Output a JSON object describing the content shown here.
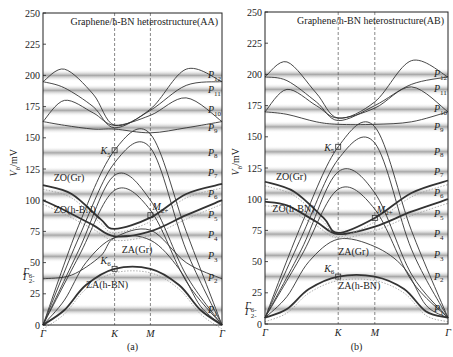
{
  "chart_data": [
    {
      "type": "line",
      "panel": "(a)",
      "title": "Graphene/h-BN heterostructure(AA)",
      "xlabel": "",
      "ylabel": "V_b/mV",
      "ylim": [
        0,
        250
      ],
      "yticks": [
        0,
        25,
        50,
        75,
        100,
        125,
        150,
        175,
        200,
        225,
        250
      ],
      "xticks": [
        "Γ",
        "K",
        "M",
        "Γ"
      ],
      "x": [
        0,
        1,
        1.5,
        2.5
      ],
      "peak_labels": [
        "P1",
        "P2",
        "P3",
        "P4",
        "P5",
        "P6",
        "P7",
        "P8",
        "P9",
        "P10",
        "P11",
        "P12"
      ],
      "peak_positions_mV": [
        12,
        38,
        55,
        72,
        88,
        105,
        122,
        138,
        158,
        172,
        188,
        200
      ],
      "annotations": [
        {
          "text": "K5",
          "x": 1,
          "y": 140
        },
        {
          "text": "M2+",
          "x": 1.5,
          "y": 88
        },
        {
          "text": "K6",
          "x": 1,
          "y": 45
        },
        {
          "text": "Γ6-",
          "x": 0,
          "y": 40
        },
        {
          "text": "Γ2-",
          "x": 0,
          "y": 36
        },
        {
          "text": "ZO(Gr)",
          "x": 0.15,
          "y": 115
        },
        {
          "text": "ZO(h-BN)",
          "x": 0.15,
          "y": 90
        },
        {
          "text": "ZA(Gr)",
          "x": 1.1,
          "y": 58
        },
        {
          "text": "ZA(h-BN)",
          "x": 0.6,
          "y": 30
        }
      ],
      "series": [
        {
          "name": "ZA(h-BN)",
          "x": [
            0,
            0.3,
            0.6,
            1,
            1.5,
            1.9,
            2.2,
            2.5
          ],
          "y": [
            0,
            12,
            32,
            45,
            45,
            32,
            12,
            0
          ],
          "bold": true
        },
        {
          "name": "ZA(Gr)",
          "x": [
            0,
            0.3,
            0.6,
            1,
            1.5,
            1.9,
            2.2,
            2.5
          ],
          "y": [
            0,
            20,
            50,
            70,
            68,
            45,
            15,
            0
          ]
        },
        {
          "name": "ZO(h-BN)",
          "x": [
            0,
            0.3,
            0.7,
            1,
            1.5,
            2.0,
            2.5
          ],
          "y": [
            100,
            92,
            80,
            71,
            75,
            88,
            100
          ],
          "bold": true
        },
        {
          "name": "ZO(Gr)",
          "x": [
            0,
            0.4,
            0.8,
            1,
            1.5,
            2.0,
            2.5
          ],
          "y": [
            112,
            105,
            85,
            77,
            86,
            105,
            113
          ],
          "bold": true
        },
        {
          "name": "Γ-flat",
          "x": [
            0,
            0.4,
            0.8,
            1,
            1.5,
            2.0,
            2.5
          ],
          "y": [
            37,
            40,
            55,
            70,
            76,
            50,
            37
          ]
        },
        {
          "name": "LA-1",
          "x": [
            0,
            0.5,
            1,
            1.5,
            2.0,
            2.5
          ],
          "y": [
            0,
            60,
            120,
            100,
            40,
            0
          ]
        },
        {
          "name": "LA-2",
          "x": [
            0,
            0.5,
            1,
            1.5,
            2.0,
            2.5
          ],
          "y": [
            0,
            55,
            108,
            92,
            35,
            0
          ]
        },
        {
          "name": "TO-1",
          "x": [
            0,
            0.5,
            1,
            1.5,
            2.0,
            2.5
          ],
          "y": [
            0,
            70,
            130,
            142,
            60,
            0
          ]
        },
        {
          "name": "K5-band",
          "x": [
            0,
            0.5,
            1,
            1.5,
            2.0,
            2.5
          ],
          "y": [
            0,
            80,
            140,
            153,
            75,
            0
          ]
        },
        {
          "name": "upper-1",
          "x": [
            0,
            0.3,
            0.7,
            1,
            1.5,
            2.0,
            2.5
          ],
          "y": [
            163,
            160,
            157,
            157,
            154,
            158,
            163
          ]
        },
        {
          "name": "upper-2",
          "x": [
            0,
            0.3,
            0.7,
            1,
            1.5,
            2.0,
            2.5
          ],
          "y": [
            195,
            205,
            185,
            160,
            173,
            205,
            195
          ]
        },
        {
          "name": "upper-3",
          "x": [
            0,
            0.3,
            0.7,
            1,
            1.5,
            2.0,
            2.5
          ],
          "y": [
            195,
            190,
            175,
            158,
            172,
            192,
            195
          ]
        },
        {
          "name": "upper-4",
          "x": [
            0,
            0.3,
            0.7,
            1,
            1.5,
            2.0,
            2.5
          ],
          "y": [
            163,
            180,
            170,
            160,
            168,
            182,
            163
          ]
        }
      ]
    },
    {
      "type": "line",
      "panel": "(b)",
      "title": "Graphene/h-BN heterostructure(AB)",
      "xlabel": "",
      "ylabel": "V_b/mV",
      "ylim": [
        0,
        250
      ],
      "yticks": [
        0,
        25,
        50,
        75,
        100,
        125,
        150,
        175,
        200,
        225,
        250
      ],
      "xticks": [
        "Γ",
        "K",
        "M",
        "Γ"
      ],
      "x": [
        0,
        1,
        1.5,
        2.5
      ],
      "peak_labels": [
        "P1",
        "P2",
        "P3",
        "P4",
        "P5",
        "P6",
        "P7",
        "P8",
        "P9",
        "P10",
        "P11",
        "P12"
      ],
      "peak_positions_mV": [
        12,
        38,
        55,
        72,
        88,
        105,
        122,
        138,
        158,
        172,
        188,
        200
      ],
      "annotations": [
        {
          "text": "K5",
          "x": 1,
          "y": 142
        },
        {
          "text": "M2+",
          "x": 1.5,
          "y": 85
        },
        {
          "text": "K6",
          "x": 1,
          "y": 38
        },
        {
          "text": "Γ6-",
          "x": 0,
          "y": 12
        },
        {
          "text": "Γ2-",
          "x": 0,
          "y": 7
        },
        {
          "text": "ZO(Gr)",
          "x": 0.15,
          "y": 115
        },
        {
          "text": "ZO(h-BN)",
          "x": 0.1,
          "y": 90
        },
        {
          "text": "ZA(Gr)",
          "x": 1,
          "y": 55
        },
        {
          "text": "ZA(h-BN)",
          "x": 1,
          "y": 28
        }
      ],
      "series": [
        {
          "name": "ZA(h-BN)",
          "x": [
            0,
            0.3,
            0.6,
            1,
            1.5,
            1.9,
            2.2,
            2.5
          ],
          "y": [
            5,
            12,
            28,
            38,
            38,
            28,
            10,
            5
          ],
          "bold": true
        },
        {
          "name": "ZA(Gr)",
          "x": [
            0,
            0.3,
            0.6,
            1,
            1.5,
            1.9,
            2.2,
            2.5
          ],
          "y": [
            5,
            22,
            50,
            68,
            62,
            45,
            15,
            5
          ]
        },
        {
          "name": "ZO(h-BN)",
          "x": [
            0,
            0.3,
            0.7,
            1,
            1.5,
            2.0,
            2.5
          ],
          "y": [
            98,
            95,
            82,
            72,
            78,
            90,
            100
          ],
          "bold": true
        },
        {
          "name": "ZO(Gr)",
          "x": [
            0,
            0.4,
            0.8,
            1,
            1.5,
            2.0,
            2.5
          ],
          "y": [
            114,
            106,
            85,
            73,
            85,
            105,
            115
          ],
          "bold": true
        },
        {
          "name": "LA-1",
          "x": [
            0,
            0.5,
            1,
            1.5,
            2.0,
            2.5
          ],
          "y": [
            5,
            60,
            122,
            105,
            40,
            5
          ]
        },
        {
          "name": "LA-2",
          "x": [
            0,
            0.5,
            1,
            1.5,
            2.0,
            2.5
          ],
          "y": [
            5,
            55,
            108,
            92,
            35,
            5
          ]
        },
        {
          "name": "TO-1",
          "x": [
            0,
            0.5,
            1,
            1.5,
            2.0,
            2.5
          ],
          "y": [
            5,
            70,
            132,
            145,
            60,
            5
          ]
        },
        {
          "name": "K5-band",
          "x": [
            0,
            0.5,
            1,
            1.5,
            2.0,
            2.5
          ],
          "y": [
            5,
            80,
            142,
            158,
            75,
            5
          ]
        },
        {
          "name": "upper-1",
          "x": [
            0,
            0.3,
            0.7,
            1,
            1.5,
            2.0,
            2.5
          ],
          "y": [
            170,
            168,
            162,
            160,
            160,
            162,
            170
          ]
        },
        {
          "name": "upper-2",
          "x": [
            0,
            0.3,
            0.7,
            1,
            1.5,
            2.0,
            2.5
          ],
          "y": [
            198,
            210,
            185,
            165,
            178,
            211,
            198
          ]
        },
        {
          "name": "upper-3",
          "x": [
            0,
            0.3,
            0.7,
            1,
            1.5,
            2.0,
            2.5
          ],
          "y": [
            198,
            195,
            178,
            163,
            175,
            192,
            198
          ]
        },
        {
          "name": "upper-4",
          "x": [
            0,
            0.3,
            0.7,
            1,
            1.5,
            2.0,
            2.5
          ],
          "y": [
            170,
            188,
            175,
            165,
            173,
            190,
            170
          ]
        }
      ]
    }
  ],
  "panels": [
    {
      "caption": "(a)",
      "title": "Graphene/h-BN heterostructure(AA)"
    },
    {
      "caption": "(b)",
      "title": "Graphene/h-BN heterostructure(AB)"
    }
  ],
  "axis": {
    "ylabel_main": "V",
    "ylabel_sub": "b",
    "ylabel_unit": "/mV"
  },
  "colors": {
    "line": "#333333",
    "band_dark": "#8a8a8a",
    "frame": "#222222",
    "dashed": "#555555",
    "dotted": "#999999"
  }
}
